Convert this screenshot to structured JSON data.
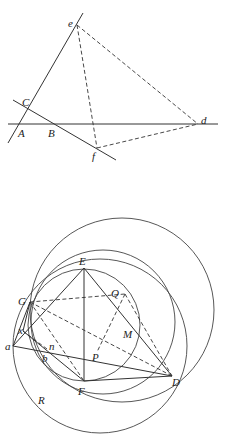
{
  "figure_top": {
    "labels": {
      "e": "e",
      "C": "C",
      "A": "A",
      "B": "B",
      "d": "d",
      "f": "f"
    }
  },
  "figure_bottom": {
    "labels": {
      "E": "E",
      "G": "G",
      "Q": "Q",
      "M": "M",
      "x": "x",
      "a": "a",
      "n": "n",
      "b": "b",
      "P": "P",
      "F": "F",
      "D": "D",
      "R": "R"
    }
  },
  "colors": {
    "stroke": "#333333",
    "background": "#ffffff"
  }
}
